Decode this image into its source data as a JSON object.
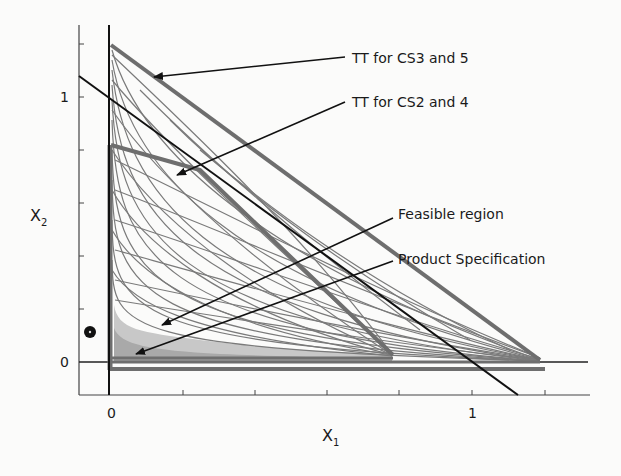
{
  "figure": {
    "x_axis": {
      "label": "X",
      "subscript": "1",
      "tick_labels": [
        "0",
        "1"
      ],
      "range": [
        0,
        1.2
      ]
    },
    "y_axis": {
      "label": "X",
      "subscript": "2",
      "tick_labels": [
        "0",
        "1"
      ],
      "range": [
        0,
        1.2
      ]
    },
    "annotations": [
      {
        "id": "tt_cs3_5",
        "text": "TT for CS3 and 5"
      },
      {
        "id": "tt_cs2_4",
        "text": "TT for CS2 and 4"
      },
      {
        "id": "feasible",
        "text": "Feasible region"
      },
      {
        "id": "product_spec",
        "text": "Product Specification"
      }
    ],
    "regions": {
      "tt_cs3_5": {
        "vertices": [
          [
            0,
            1.2
          ],
          [
            0,
            0
          ],
          [
            1.2,
            0
          ]
        ],
        "color": "#6e6e6e"
      },
      "tt_cs2_4": {
        "vertices": [
          [
            0,
            0.82
          ],
          [
            0,
            0
          ],
          [
            0.78,
            0.02
          ]
        ],
        "color": "#6e6e6e"
      },
      "feasible_region": {
        "fill": "#c8c8c8"
      },
      "product_specification": {
        "fill": "#a8a8a8"
      }
    },
    "lines": {
      "black_diagonal": {
        "from": [
          -0.09,
          1.08
        ],
        "to": [
          1.13,
          -0.12
        ],
        "color": "#111111"
      }
    },
    "colors": {
      "curves": "#7a7a7a",
      "axes": "#333333",
      "background": "#fbfbfa"
    }
  }
}
